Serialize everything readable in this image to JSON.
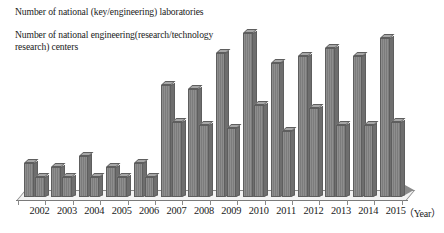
{
  "chart_data": {
    "type": "bar",
    "title": "",
    "subtitle": "",
    "xlabel": "（Year）",
    "ylabel": "",
    "grid": false,
    "legend_position": "top-left",
    "axis_style": "3d-clustered-column",
    "ylim": [
      0,
      100
    ],
    "categories": [
      "2002",
      "2003",
      "2004",
      "2005",
      "2006",
      "2007",
      "2008",
      "2009",
      "2010",
      "2011",
      "2012",
      "2013",
      "2014",
      "2015"
    ],
    "series": [
      {
        "name": "Number of national (key/engineering) laboratories",
        "color": "#808080",
        "values": [
          21,
          18,
          25,
          18,
          21,
          68,
          66,
          88,
          100,
          82,
          86,
          91,
          86,
          97
        ]
      },
      {
        "name": "Number of national engineering(research/technology research) centers",
        "color": "#808080",
        "values": [
          12,
          12,
          12,
          12,
          12,
          46,
          44,
          42,
          56,
          40,
          54,
          44,
          44,
          46
        ]
      }
    ],
    "annotations": []
  },
  "legend": {
    "entries": [
      {
        "marker": "square-swatch",
        "label": "Number of national (key/engineering) laboratories"
      },
      {
        "marker": "square-swatch",
        "label": "Number of national engineering(research/technology research) centers"
      }
    ]
  },
  "axis": {
    "year_label": "（Year）",
    "tick_labels": [
      "2002",
      "2003",
      "2004",
      "2005",
      "2006",
      "2007",
      "2008",
      "2009",
      "2010",
      "2011",
      "2012",
      "2013",
      "2014",
      "2015"
    ]
  },
  "colors": {
    "bar_face": "#808080",
    "bar_edge": "#5e5e5e",
    "bar_top": "#a6a6a6",
    "bar_side": "#6e6e6e",
    "axis": "#8a8a8a",
    "text": "#1a1a1a",
    "background": "#ffffff"
  }
}
